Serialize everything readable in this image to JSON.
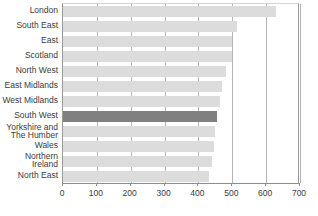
{
  "chart_data": {
    "type": "bar",
    "orientation": "horizontal",
    "title": "",
    "subtitle": "",
    "xlabel": "",
    "ylabel": "",
    "xlim": [
      0,
      700
    ],
    "xticks": [
      "0",
      "100",
      "200",
      "300",
      "400",
      "500",
      "600",
      "700"
    ],
    "xtick_values": [
      0,
      100,
      200,
      300,
      400,
      500,
      600,
      700
    ],
    "grid": "vertical",
    "legend": "none",
    "categories": [
      "London",
      "South East",
      "East",
      "Scotland",
      "North West",
      "East Midlands",
      "West Midlands",
      "South West",
      "Yorkshire and\nThe Humber",
      "Wales",
      "Northern Ireland",
      "North East"
    ],
    "values": [
      630,
      515,
      500,
      498,
      480,
      470,
      465,
      455,
      450,
      445,
      440,
      430
    ],
    "highlighted_category": "South West",
    "colors": {
      "bar": "#dcdcdc",
      "bar_highlight": "#808080",
      "gridline": "#b4b4b4",
      "axis": "#8c8c8c",
      "text": "#3a3a3a",
      "background": "#ffffff"
    }
  }
}
